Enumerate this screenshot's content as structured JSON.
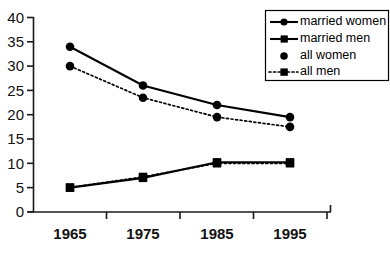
{
  "chart_data": {
    "type": "line",
    "title": "",
    "xlabel": "",
    "ylabel": "",
    "x": [
      1965,
      1975,
      1985,
      1995
    ],
    "categories": [
      "1965",
      "1975",
      "1985",
      "1995"
    ],
    "xtick_labels": [
      "1965",
      "1975",
      "1985",
      "1995"
    ],
    "ytick_labels": [
      "0",
      "5",
      "10",
      "15",
      "20",
      "25",
      "30",
      "35",
      "40"
    ],
    "yticks": [
      0,
      5,
      10,
      15,
      20,
      25,
      30,
      35,
      40
    ],
    "ylim": [
      0,
      40
    ],
    "grid": false,
    "legend_position": "top-right",
    "series": [
      {
        "name": "married women",
        "values": [
          34,
          26,
          22,
          19.5
        ],
        "line_style": "solid",
        "marker": "circle"
      },
      {
        "name": "married men",
        "values": [
          5,
          7,
          10.2,
          10.2
        ],
        "line_style": "solid",
        "marker": "square"
      },
      {
        "name": "all women",
        "values": [
          30,
          23.5,
          19.5,
          17.5
        ],
        "line_style": "dotted",
        "marker": "circle"
      },
      {
        "name": "all men",
        "values": [
          5,
          7.2,
          10,
          10
        ],
        "line_style": "dotted",
        "marker": "square"
      }
    ]
  },
  "legend": {
    "items": [
      {
        "label": "married women",
        "marker": "circle",
        "line": "solid"
      },
      {
        "label": "married men",
        "marker": "square",
        "line": "solid"
      },
      {
        "label": "all women",
        "marker": "circle",
        "line": "none"
      },
      {
        "label": "all men",
        "marker": "square",
        "line": "dotted"
      }
    ]
  },
  "axes": {
    "y_labels": [
      "40",
      "35",
      "30",
      "25",
      "20",
      "15",
      "10",
      "5",
      "0"
    ],
    "x_labels": [
      "1965",
      "1975",
      "1985",
      "1995"
    ]
  },
  "colors": {
    "ink": "#000000",
    "background": "#ffffff"
  }
}
